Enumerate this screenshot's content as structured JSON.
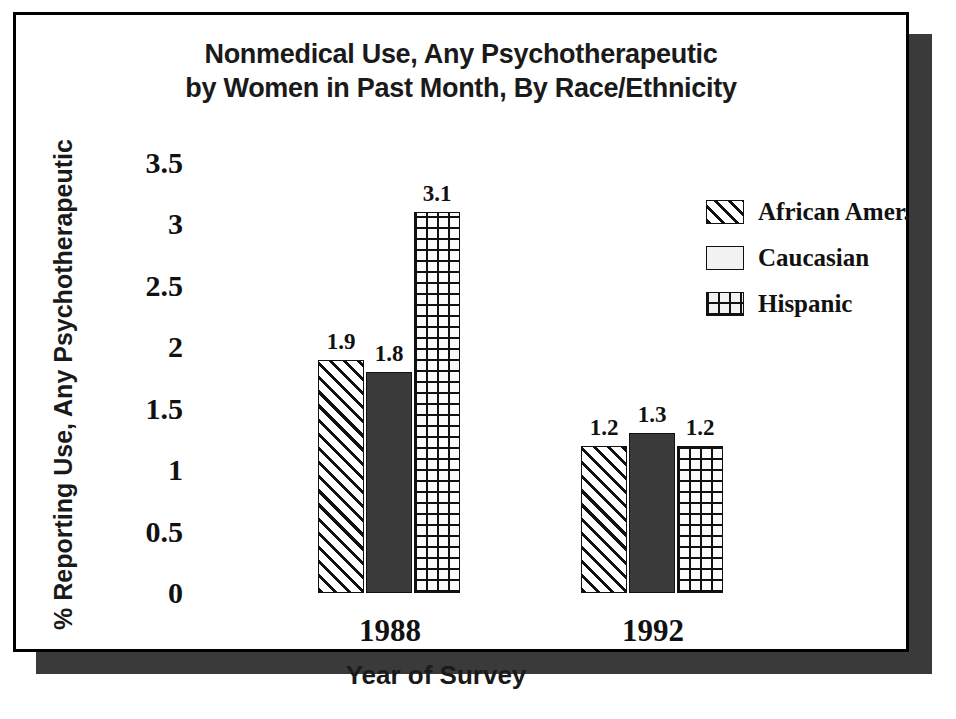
{
  "chart_data": {
    "type": "bar",
    "title": "Nonmedical Use, Any Psychotherapeutic by Women in Past Month, By Race/Ethnicity",
    "title_line1": "Nonmedical Use, Any Psychotherapeutic",
    "title_line2": "by Women in Past Month, By Race/Ethnicity",
    "xlabel": "Year of Survey",
    "ylabel": "% Reporting Use, Any Psychotherapeutic",
    "categories": [
      "1988",
      "1992"
    ],
    "series": [
      {
        "name": "African Amer.",
        "pattern": "diagonal-hatch",
        "values": [
          1.9,
          1.2
        ],
        "labels": [
          "1.9",
          "1.2"
        ]
      },
      {
        "name": "Caucasian",
        "pattern": "solid-dark",
        "values": [
          1.8,
          1.3
        ],
        "labels": [
          "1.8",
          "1.3"
        ]
      },
      {
        "name": "Hispanic",
        "pattern": "grid-crosshatch",
        "values": [
          3.1,
          1.2
        ],
        "labels": [
          "3.1",
          "1.2"
        ]
      }
    ],
    "ylim": [
      0,
      3.5
    ],
    "yticks": [
      "0",
      "0.5",
      "1",
      "1.5",
      "2",
      "2.5",
      "3",
      "3.5"
    ],
    "ytick_values": [
      0,
      0.5,
      1,
      1.5,
      2,
      2.5,
      3,
      3.5
    ],
    "grid": false,
    "legend_position": "top-right",
    "colors": {
      "ink": "#111111",
      "solid_fill": "#3a3a3a",
      "background": "#ffffff",
      "frame": "#000000",
      "shadow": "#3a3a3a"
    }
  }
}
